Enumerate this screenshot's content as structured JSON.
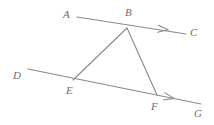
{
  "figure": {
    "kind": "geometry-diagram",
    "background_color": "#ffffff",
    "stroke_color": "#8a8a8a",
    "label_color": "#6e6e6e",
    "stroke_width": 1.1,
    "labels": [
      {
        "id": "A",
        "text": "A",
        "x": 63,
        "y": 9
      },
      {
        "id": "B",
        "text": "B",
        "x": 125,
        "y": 7
      },
      {
        "id": "C",
        "text": "C",
        "x": 190,
        "y": 27
      },
      {
        "id": "D",
        "text": "D",
        "x": 13,
        "y": 70
      },
      {
        "id": "E",
        "text": "E",
        "x": 66,
        "y": 85
      },
      {
        "id": "F",
        "text": "F",
        "x": 151,
        "y": 101
      },
      {
        "id": "G",
        "text": "G",
        "x": 194,
        "y": 108
      }
    ],
    "points": {
      "A": {
        "x": 77,
        "y": 17
      },
      "B": {
        "x": 127,
        "y": 28
      },
      "C": {
        "x": 186,
        "y": 34
      },
      "D": {
        "x": 28,
        "y": 69
      },
      "E": {
        "x": 73,
        "y": 80
      },
      "F": {
        "x": 157,
        "y": 95
      },
      "G": {
        "x": 201,
        "y": 104
      }
    },
    "segments": [
      {
        "id": "line-ABC",
        "name": "ray-a-to-c",
        "from": "A",
        "to": "C",
        "arrow": true
      },
      {
        "id": "line-DEFG",
        "name": "ray-d-to-g",
        "from": "D",
        "to": "G",
        "arrow": true
      },
      {
        "id": "seg-BE",
        "name": "segment-b-to-e",
        "from": "B",
        "to": "E",
        "arrow": false
      },
      {
        "id": "seg-BF",
        "name": "segment-b-to-f",
        "from": "B",
        "to": "F",
        "arrow": false
      }
    ],
    "arrowheads": [
      {
        "id": "arrow-on-bc",
        "name": "arrowhead-toward-c",
        "tip_x": 168,
        "tip_y": 29.8,
        "angle_deg": 6.2
      },
      {
        "id": "arrow-on-fg",
        "name": "arrowhead-toward-g",
        "tip_x": 174,
        "tip_y": 98.4,
        "angle_deg": 11.5
      }
    ]
  }
}
